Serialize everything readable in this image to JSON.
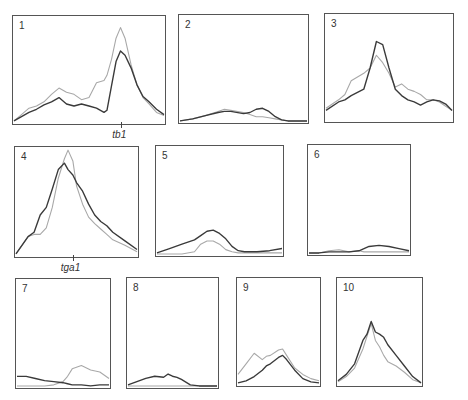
{
  "colors": {
    "dark": "#3a3a3a",
    "light": "#a8a8a8",
    "border": "#555555"
  },
  "chart_data": {
    "type": "line",
    "title": "",
    "series_names": [
      "dark",
      "light"
    ],
    "panels": [
      {
        "label": "1",
        "marker": "tb1",
        "marker_x": 0.71,
        "x": [
          0,
          0.05,
          0.1,
          0.15,
          0.2,
          0.25,
          0.3,
          0.35,
          0.4,
          0.45,
          0.5,
          0.55,
          0.6,
          0.62,
          0.65,
          0.68,
          0.71,
          0.74,
          0.78,
          0.82,
          0.86,
          0.9,
          0.95,
          1
        ],
        "dark": [
          0.02,
          0.06,
          0.1,
          0.13,
          0.17,
          0.2,
          0.24,
          0.18,
          0.16,
          0.18,
          0.16,
          0.14,
          0.1,
          0.12,
          0.35,
          0.58,
          0.68,
          0.64,
          0.52,
          0.36,
          0.25,
          0.2,
          0.13,
          0.08
        ],
        "light": [
          0.02,
          0.08,
          0.14,
          0.16,
          0.2,
          0.27,
          0.33,
          0.29,
          0.27,
          0.22,
          0.24,
          0.38,
          0.4,
          0.45,
          0.6,
          0.8,
          0.9,
          0.8,
          0.55,
          0.36,
          0.24,
          0.18,
          0.1,
          0.07
        ]
      },
      {
        "label": "2",
        "x": [
          0,
          0.1,
          0.2,
          0.3,
          0.35,
          0.4,
          0.5,
          0.55,
          0.6,
          0.65,
          0.7,
          0.75,
          0.8,
          0.85,
          0.9,
          1
        ],
        "dark": [
          0.01,
          0.03,
          0.06,
          0.09,
          0.1,
          0.1,
          0.08,
          0.09,
          0.12,
          0.13,
          0.1,
          0.05,
          0.02,
          0.01,
          0.01,
          0.01
        ],
        "light": [
          0.01,
          0.03,
          0.06,
          0.1,
          0.12,
          0.11,
          0.09,
          0.07,
          0.05,
          0.05,
          0.04,
          0.03,
          0.02,
          0.01,
          0.01,
          0.01
        ]
      },
      {
        "label": "3",
        "x": [
          0,
          0.1,
          0.15,
          0.2,
          0.3,
          0.35,
          0.4,
          0.45,
          0.5,
          0.55,
          0.6,
          0.65,
          0.7,
          0.75,
          0.8,
          0.85,
          0.9,
          0.95,
          1
        ],
        "dark": [
          0.1,
          0.18,
          0.2,
          0.24,
          0.3,
          0.5,
          0.75,
          0.72,
          0.5,
          0.3,
          0.24,
          0.2,
          0.18,
          0.15,
          0.18,
          0.2,
          0.19,
          0.16,
          0.1
        ],
        "light": [
          0.12,
          0.2,
          0.25,
          0.38,
          0.45,
          0.5,
          0.62,
          0.55,
          0.45,
          0.32,
          0.35,
          0.3,
          0.28,
          0.25,
          0.2,
          0.2,
          0.18,
          0.14,
          0.1
        ]
      },
      {
        "label": "4",
        "marker": "tga1",
        "marker_x": 0.47,
        "x": [
          0,
          0.1,
          0.15,
          0.2,
          0.25,
          0.3,
          0.35,
          0.4,
          0.43,
          0.47,
          0.5,
          0.55,
          0.6,
          0.65,
          0.7,
          0.75,
          0.8,
          0.9,
          1
        ],
        "dark": [
          0.02,
          0.18,
          0.22,
          0.38,
          0.45,
          0.62,
          0.8,
          0.86,
          0.8,
          0.75,
          0.68,
          0.6,
          0.48,
          0.38,
          0.32,
          0.28,
          0.22,
          0.14,
          0.06
        ],
        "light": [
          0.02,
          0.18,
          0.2,
          0.2,
          0.26,
          0.45,
          0.72,
          0.9,
          0.98,
          0.88,
          0.65,
          0.48,
          0.36,
          0.3,
          0.25,
          0.2,
          0.15,
          0.1,
          0.04
        ]
      },
      {
        "label": "5",
        "x": [
          0,
          0.1,
          0.2,
          0.3,
          0.35,
          0.4,
          0.45,
          0.5,
          0.55,
          0.6,
          0.65,
          0.7,
          0.75,
          0.8,
          0.9,
          1
        ],
        "dark": [
          0.02,
          0.06,
          0.1,
          0.14,
          0.18,
          0.22,
          0.23,
          0.2,
          0.15,
          0.08,
          0.04,
          0.03,
          0.03,
          0.03,
          0.04,
          0.06
        ],
        "light": [
          0.01,
          0.01,
          0.01,
          0.03,
          0.1,
          0.13,
          0.13,
          0.1,
          0.05,
          0.03,
          0.02,
          0.02,
          0.02,
          0.02,
          0.02,
          0.02
        ]
      },
      {
        "label": "6",
        "x": [
          0,
          0.1,
          0.2,
          0.3,
          0.4,
          0.5,
          0.55,
          0.6,
          0.7,
          0.8,
          0.9,
          1
        ],
        "dark": [
          0.01,
          0.01,
          0.02,
          0.02,
          0.02,
          0.03,
          0.05,
          0.07,
          0.08,
          0.07,
          0.05,
          0.03
        ],
        "light": [
          0.01,
          0.01,
          0.03,
          0.04,
          0.02,
          0.03,
          0.02,
          0.02,
          0.02,
          0.02,
          0.02,
          0.02
        ]
      },
      {
        "label": "7",
        "x": [
          0,
          0.1,
          0.2,
          0.3,
          0.4,
          0.5,
          0.55,
          0.6,
          0.7,
          0.8,
          0.9,
          1
        ],
        "dark": [
          0.1,
          0.1,
          0.08,
          0.06,
          0.05,
          0.04,
          0.03,
          0.02,
          0.02,
          0.01,
          0.02,
          0.02
        ],
        "light": [
          0.01,
          0.01,
          0.01,
          0.01,
          0.02,
          0.05,
          0.1,
          0.17,
          0.2,
          0.16,
          0.14,
          0.08
        ]
      },
      {
        "label": "8",
        "x": [
          0,
          0.1,
          0.2,
          0.3,
          0.4,
          0.45,
          0.5,
          0.55,
          0.6,
          0.7,
          0.8,
          0.9,
          1
        ],
        "dark": [
          0.02,
          0.05,
          0.08,
          0.1,
          0.09,
          0.12,
          0.1,
          0.09,
          0.07,
          0.02,
          0.01,
          0.01,
          0.01
        ],
        "light": [
          0.01,
          0.01,
          0.01,
          0.01,
          0.01,
          0.01,
          0.01,
          0.01,
          0.01,
          0.01,
          0.01,
          0.01,
          0.01
        ]
      },
      {
        "label": "9",
        "x": [
          0,
          0.1,
          0.2,
          0.3,
          0.35,
          0.4,
          0.5,
          0.55,
          0.6,
          0.7,
          0.8,
          0.9,
          1
        ],
        "dark": [
          0.02,
          0.04,
          0.08,
          0.14,
          0.18,
          0.2,
          0.26,
          0.28,
          0.24,
          0.14,
          0.06,
          0.03,
          0.02
        ],
        "light": [
          0.1,
          0.2,
          0.3,
          0.24,
          0.27,
          0.28,
          0.33,
          0.34,
          0.28,
          0.16,
          0.1,
          0.06,
          0.04
        ]
      },
      {
        "label": "10",
        "x": [
          0,
          0.1,
          0.2,
          0.3,
          0.35,
          0.4,
          0.45,
          0.5,
          0.55,
          0.6,
          0.7,
          0.8,
          0.9,
          1
        ],
        "dark": [
          0.04,
          0.1,
          0.2,
          0.42,
          0.48,
          0.6,
          0.5,
          0.48,
          0.45,
          0.38,
          0.28,
          0.18,
          0.08,
          0.02
        ],
        "light": [
          0.03,
          0.08,
          0.16,
          0.34,
          0.46,
          0.58,
          0.42,
          0.36,
          0.28,
          0.22,
          0.18,
          0.12,
          0.05,
          0.02
        ]
      }
    ]
  }
}
